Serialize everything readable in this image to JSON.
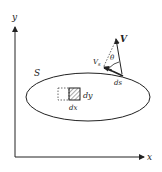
{
  "diagram": {
    "axes": {
      "x_label": "x",
      "y_label": "y"
    },
    "region_label": "S",
    "element_labels": {
      "dx": "dx",
      "dy": "dy"
    },
    "vector": {
      "label": "V",
      "component_label": "V",
      "component_subscript": "s",
      "angle_label": "θ",
      "arc_label": "ds"
    },
    "colors": {
      "stroke": "#222222",
      "hatch": "#555555",
      "caption": "#bbbbbb"
    }
  },
  "caption": ""
}
